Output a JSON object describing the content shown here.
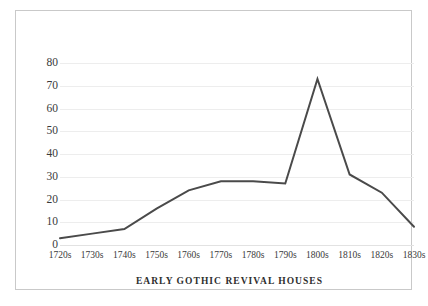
{
  "chart_data": {
    "type": "line",
    "title": "EARLY GOTHIC REVIVAL HOUSES",
    "xlabel": "",
    "ylabel": "",
    "categories": [
      "1720s",
      "1730s",
      "1740s",
      "1750s",
      "1760s",
      "1770s",
      "1780s",
      "1790s",
      "1800s",
      "1810s",
      "1820s",
      "1830s"
    ],
    "values": [
      3,
      5,
      7,
      16,
      24,
      28,
      28,
      27,
      73,
      31,
      23,
      8
    ],
    "series": [
      {
        "name": "Early Gothic Revival Houses",
        "values": [
          3,
          5,
          7,
          16,
          24,
          28,
          28,
          27,
          73,
          31,
          23,
          8
        ]
      }
    ],
    "ylim": [
      0,
      80
    ],
    "yticks": [
      0,
      10,
      20,
      30,
      40,
      50,
      60,
      70,
      80
    ],
    "ytick_labels": [
      "0",
      "10",
      "20",
      "30",
      "40",
      "50",
      "60",
      "70",
      "80"
    ],
    "grid": true,
    "grid_axis": "y",
    "legend": false,
    "legend_position": "none",
    "line_color": "#4a4a4a",
    "grid_color": "#ededed",
    "background_color": "#ffffff",
    "border_color": "#c9c9c9",
    "text_color": "#3a3a3a",
    "markers": false,
    "line_width": 2
  }
}
